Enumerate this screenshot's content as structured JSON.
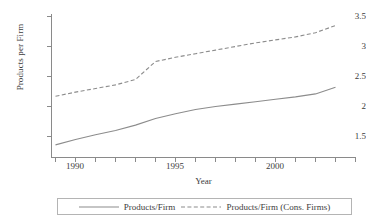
{
  "chart_data": {
    "type": "line",
    "title": "",
    "xlabel": "Year",
    "ylabel": "Products per Firm",
    "xlim": [
      1988.7,
      2003.3
    ],
    "ylim": [
      1.3,
      3.55
    ],
    "grid": false,
    "legend_position": "bottom",
    "x_ticks_labeled": [
      "1990",
      "1995",
      "2000"
    ],
    "x_ticks_labeled_values": [
      1990,
      1995,
      2000
    ],
    "x_minor_ticks": [
      1989,
      1990,
      1991,
      1992,
      1993,
      1994,
      1995,
      1996,
      1997,
      1998,
      1999,
      2000,
      2001,
      2002,
      2003
    ],
    "y_ticks": [
      1.5,
      2,
      2.5,
      3,
      3.5
    ],
    "y_tick_labels": [
      "1.5",
      "2",
      "2.5",
      "3",
      "3.5"
    ],
    "x": [
      1989,
      1990,
      1991,
      1992,
      1993,
      1994,
      1995,
      1996,
      1997,
      1998,
      1999,
      2000,
      2001,
      2002,
      2003
    ],
    "series": [
      {
        "name": "Products/Firm",
        "style": "solid",
        "color": "#8c8c8c",
        "values": [
          1.36,
          1.45,
          1.53,
          1.6,
          1.69,
          1.8,
          1.88,
          1.95,
          2.0,
          2.04,
          2.08,
          2.12,
          2.16,
          2.21,
          2.32
        ]
      },
      {
        "name": "Products/Firm (Cons. Firms)",
        "style": "dashed",
        "color": "#8c8c8c",
        "values": [
          2.17,
          2.24,
          2.3,
          2.36,
          2.45,
          2.75,
          2.82,
          2.88,
          2.94,
          3.0,
          3.06,
          3.11,
          3.16,
          3.23,
          3.35
        ]
      }
    ]
  },
  "axes": {
    "y_label": "Products per Firm",
    "x_label": "Year",
    "y_tick_labels": [
      "3.5",
      "3",
      "2.5",
      "2",
      "1.5"
    ],
    "x_tick_labels": [
      "1990",
      "1995",
      "2000"
    ]
  },
  "legend": {
    "entries": [
      {
        "label": "Products/Firm",
        "style": "solid"
      },
      {
        "label": "Products/Firm (Cons. Firms)",
        "style": "dashed"
      }
    ]
  },
  "colors": {
    "line": "#8c8c8c",
    "axis": "#8a8a8a",
    "text": "#3c3c3c",
    "legend_border": "#b4b4b4",
    "background": "#ffffff"
  }
}
